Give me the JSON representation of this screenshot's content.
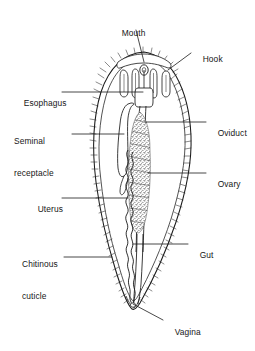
{
  "figure": {
    "background_color": "#ffffff",
    "ink_color": "#1a1a1a",
    "stipple_color": "#3a3a3a"
  },
  "labels": [
    {
      "id": "mouth",
      "text": "Mouth",
      "line2": "",
      "side": "top",
      "x": 112,
      "y": 17,
      "leader": {
        "x1": 136,
        "y1": 30,
        "x2": 144,
        "y2": 60
      }
    },
    {
      "id": "hook",
      "text": "Hook",
      "line2": "",
      "side": "right",
      "x": 193,
      "y": 43,
      "leader": {
        "x1": 191,
        "y1": 53,
        "x2": 168,
        "y2": 70
      }
    },
    {
      "id": "esophagus",
      "text": "Esophagus",
      "line2": "",
      "side": "left",
      "x": 14,
      "y": 87,
      "leader": {
        "x1": 62,
        "y1": 92,
        "x2": 143,
        "y2": 92
      }
    },
    {
      "id": "oviduct",
      "text": "Oviduct",
      "line2": "",
      "side": "right",
      "x": 208,
      "y": 117,
      "leader": {
        "x1": 206,
        "y1": 122,
        "x2": 145,
        "y2": 122
      }
    },
    {
      "id": "seminal-receptacle",
      "text": "Seminal",
      "line2": "receptacle",
      "side": "left",
      "x": 14,
      "y": 115,
      "leader": {
        "x1": 70,
        "y1": 134,
        "x2": 124,
        "y2": 134
      }
    },
    {
      "id": "ovary",
      "text": "Ovary",
      "line2": "",
      "side": "right",
      "x": 208,
      "y": 168,
      "leader": {
        "x1": 206,
        "y1": 173,
        "x2": 148,
        "y2": 173
      }
    },
    {
      "id": "uterus",
      "text": "Uterus",
      "line2": "",
      "side": "left",
      "x": 28,
      "y": 193,
      "leader": {
        "x1": 62,
        "y1": 198,
        "x2": 128,
        "y2": 198
      }
    },
    {
      "id": "gut",
      "text": "Gut",
      "line2": "",
      "side": "right",
      "x": 190,
      "y": 239,
      "leader": {
        "x1": 188,
        "y1": 244,
        "x2": 133,
        "y2": 244
      }
    },
    {
      "id": "chitinous-cuticle",
      "text": "Chitinous",
      "line2": "cuticle",
      "side": "left",
      "x": 22,
      "y": 238,
      "leader": {
        "x1": 64,
        "y1": 257,
        "x2": 112,
        "y2": 257
      }
    },
    {
      "id": "vagina",
      "text": "Vagina",
      "line2": "",
      "side": "right",
      "x": 165,
      "y": 318,
      "leader": {
        "x1": 163,
        "y1": 320,
        "x2": 132,
        "y2": 303
      }
    }
  ],
  "structures": [
    {
      "id": "body-outline",
      "name": "chitinous cuticle body wall"
    },
    {
      "id": "hooks",
      "name": "anterior hooks",
      "count": 4
    },
    {
      "id": "mouth-opening",
      "name": "mouth opening"
    },
    {
      "id": "esophagus-tube",
      "name": "esophagus"
    },
    {
      "id": "seminal-receptacle",
      "name": "seminal receptacle loop"
    },
    {
      "id": "oviduct-tube",
      "name": "oviduct"
    },
    {
      "id": "ovary-mass",
      "name": "ovary (stippled mass)"
    },
    {
      "id": "uterus-coil",
      "name": "uterus (coiled tube)"
    },
    {
      "id": "gut-tube",
      "name": "gut"
    },
    {
      "id": "vagina-opening",
      "name": "vagina (posterior opening)"
    }
  ]
}
